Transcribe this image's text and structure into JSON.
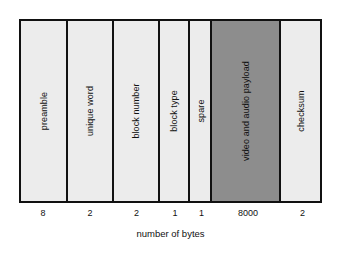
{
  "diagram": {
    "caption": "number of bytes",
    "border_color": "#111111",
    "field_fill_color": "#ececec",
    "payload_fill_color": "#8d8d8d",
    "fields": [
      {
        "label": "preamble",
        "bytes": "8",
        "width_px": 48,
        "highlight": false
      },
      {
        "label": "unique word",
        "bytes": "2",
        "width_px": 46,
        "highlight": false
      },
      {
        "label": "block number",
        "bytes": "2",
        "width_px": 47,
        "highlight": false
      },
      {
        "label": "block type",
        "bytes": "1",
        "width_px": 30,
        "highlight": false
      },
      {
        "label": "spare",
        "bytes": "1",
        "width_px": 23,
        "highlight": false
      },
      {
        "label": "video and audio payload",
        "bytes": "8000",
        "width_px": 70,
        "highlight": true
      },
      {
        "label": "checksum",
        "bytes": "2",
        "width_px": 39,
        "highlight": false
      }
    ]
  }
}
